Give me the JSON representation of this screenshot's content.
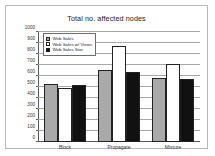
{
  "chart_data": {
    "type": "bar",
    "title": "Total no. affected nodes",
    "xlabel": "",
    "ylabel": "",
    "categories": [
      "Block",
      "Propagate",
      "Mixture"
    ],
    "series": [
      {
        "name": "Web Sales",
        "color": "#a9a9a9",
        "values": [
          525,
          655,
          585
        ]
      },
      {
        "name": "Web Sales w/ Views",
        "color": "#ffffff",
        "values": [
          490,
          870,
          705
        ]
      },
      {
        "name": "Web Sales Star",
        "color": "#111111",
        "values": [
          520,
          640,
          575
        ]
      }
    ],
    "ylim": [
      0,
      1000
    ],
    "ytick_values": [
      0,
      100,
      200,
      300,
      400,
      500,
      600,
      700,
      800,
      900,
      1000
    ],
    "ytick_labels": [
      "0",
      "100",
      "200",
      "300",
      "400",
      "500",
      "600",
      "700",
      "800",
      "900",
      "1000"
    ],
    "grid": true,
    "legend_position": "top-left"
  },
  "legend": {
    "items": [
      {
        "label": "Web Sales",
        "swatch": "gray-swatch-icon"
      },
      {
        "label": "Web Sales w/ Views",
        "swatch": "white-swatch-icon"
      },
      {
        "label": "Web Sales Star",
        "swatch": "black-swatch-icon"
      }
    ]
  }
}
